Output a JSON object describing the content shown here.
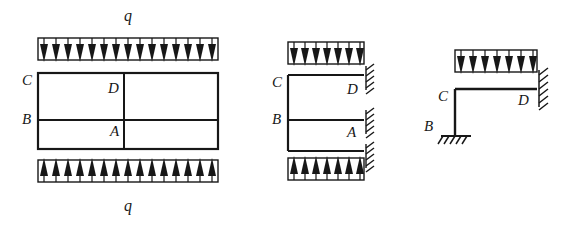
{
  "figure": {
    "background_color": "#ffffff",
    "line_color": "#171717",
    "canvas": {
      "width": 574,
      "height": 231
    }
  },
  "diagrams": [
    {
      "id": "diagram-1",
      "name": "closed-frame-with-top-and-bottom-distributed-load",
      "labels": {
        "load_top": "q",
        "load_bottom": "q",
        "node_c": "C",
        "node_b": "B",
        "node_d": "D",
        "node_a": "A"
      },
      "loads": [
        {
          "name": "top-distributed-load",
          "direction": "down",
          "arrow_count": 15,
          "x": 38,
          "y": 38,
          "width": 180,
          "height": 22,
          "label": "q"
        },
        {
          "name": "bottom-distributed-load",
          "direction": "up",
          "arrow_count": 15,
          "x": 38,
          "y": 160,
          "width": 180,
          "height": 22,
          "label": "q"
        }
      ],
      "frame": {
        "name": "rectangular-frame",
        "x": 38,
        "y": 73,
        "width": 180,
        "height": 76,
        "mid_horizontal_y": 120,
        "mid_vertical_x": 124
      },
      "supports": []
    },
    {
      "id": "diagram-2",
      "name": "half-frame-fixed-at-right-wall",
      "labels": {
        "node_c": "C",
        "node_b": "B",
        "node_d": "D",
        "node_a": "A"
      },
      "loads": [
        {
          "name": "top-distributed-load",
          "direction": "down",
          "arrow_count": 7,
          "x": 288,
          "y": 42,
          "width": 76,
          "height": 22,
          "label": ""
        },
        {
          "name": "bottom-distributed-load",
          "direction": "up",
          "arrow_count": 7,
          "x": 288,
          "y": 158,
          "width": 76,
          "height": 22,
          "label": ""
        }
      ],
      "frame": {
        "name": "half-frame",
        "x": 288,
        "y": 75,
        "width": 76,
        "height": 76,
        "mid_horizontal_y": 120
      },
      "supports": [
        {
          "name": "wall-support-top",
          "type": "fixed-wall",
          "x": 364,
          "y": 68,
          "height": 22
        },
        {
          "name": "wall-support-middle",
          "type": "fixed-wall",
          "x": 364,
          "y": 112,
          "height": 22
        },
        {
          "name": "wall-support-bottom",
          "type": "fixed-wall",
          "x": 364,
          "y": 146,
          "height": 22
        }
      ]
    },
    {
      "id": "diagram-3",
      "name": "l-frame-pinned-base-fixed-right-wall",
      "labels": {
        "node_c": "C",
        "node_b": "B",
        "node_d": "D"
      },
      "loads": [
        {
          "name": "top-distributed-load",
          "direction": "down",
          "arrow_count": 7,
          "x": 455,
          "y": 50,
          "width": 82,
          "height": 22,
          "label": ""
        }
      ],
      "frame": {
        "name": "l-shaped-frame",
        "horizontal_y": 89,
        "horizontal_x1": 455,
        "horizontal_x2": 537,
        "vertical_x": 455,
        "vertical_y1": 89,
        "vertical_y2": 135
      },
      "supports": [
        {
          "name": "ground-support-b",
          "type": "fixed-ground",
          "x": 455,
          "y": 135,
          "width": 30
        },
        {
          "name": "wall-support-d",
          "type": "fixed-wall",
          "x": 537,
          "y": 72,
          "height": 34
        }
      ]
    }
  ]
}
